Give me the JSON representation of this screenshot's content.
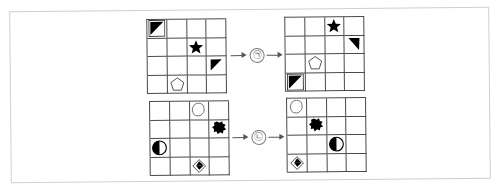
{
  "figure": {
    "title": "",
    "type": "shape-grid-transformation-diagram",
    "frame_color": "#cfcfcf",
    "grid_line_color": "#4a4a4a",
    "shape_color": "#000000",
    "arrow_color": "#555555",
    "rows": [
      {
        "id": "row-top",
        "label": "㉠",
        "label_text": "㉠",
        "source_grid": {
          "name": "top-left-grid",
          "rows": 4,
          "cols": 4,
          "cells": [
            {
              "row": 1,
              "col": 1,
              "shape": "square-with-filled-triangle"
            },
            {
              "row": 2,
              "col": 3,
              "shape": "filled-star"
            },
            {
              "row": 3,
              "col": 4,
              "shape": "filled-right-triangle"
            },
            {
              "row": 4,
              "col": 2,
              "shape": "outline-pentagon"
            }
          ]
        },
        "target_grid": {
          "name": "top-right-grid",
          "rows": 4,
          "cols": 4,
          "cells": [
            {
              "row": 1,
              "col": 3,
              "shape": "filled-star"
            },
            {
              "row": 2,
              "col": 4,
              "shape": "filled-right-triangle"
            },
            {
              "row": 3,
              "col": 2,
              "shape": "outline-pentagon"
            },
            {
              "row": 4,
              "col": 1,
              "shape": "square-with-filled-triangle"
            }
          ]
        }
      },
      {
        "id": "row-bottom",
        "label": "㉡",
        "label_text": "㉡",
        "source_grid": {
          "name": "bottom-left-grid",
          "rows": 4,
          "cols": 4,
          "cells": [
            {
              "row": 1,
              "col": 3,
              "shape": "outline-blob"
            },
            {
              "row": 2,
              "col": 4,
              "shape": "filled-blob"
            },
            {
              "row": 3,
              "col": 1,
              "shape": "half-filled-circle"
            },
            {
              "row": 4,
              "col": 3,
              "shape": "diamond-with-filled-triangle"
            }
          ]
        },
        "target_grid": {
          "name": "bottom-right-grid",
          "rows": 4,
          "cols": 4,
          "cells": [
            {
              "row": 1,
              "col": 1,
              "shape": "outline-blob"
            },
            {
              "row": 2,
              "col": 2,
              "shape": "filled-blob"
            },
            {
              "row": 3,
              "col": 3,
              "shape": "half-filled-circle"
            },
            {
              "row": 4,
              "col": 1,
              "shape": "diamond-with-filled-triangle"
            }
          ]
        }
      }
    ],
    "arrow_icon": "arrow-right-icon"
  }
}
